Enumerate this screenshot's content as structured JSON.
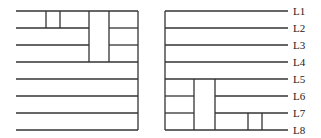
{
  "diagram": {
    "left_panel": {
      "rows_y": [
        11,
        28,
        45,
        62,
        79,
        96,
        113,
        130
      ],
      "x_start": 16,
      "x_end": 138
    },
    "right_panel": {
      "rows_y": [
        11,
        28,
        45,
        62,
        79,
        96,
        113,
        130
      ],
      "x_start": 165,
      "x_end": 288,
      "labels": [
        "L1",
        "L2",
        "L3",
        "L4",
        "L5",
        "L6",
        "L7",
        "L8"
      ]
    },
    "line_color": "#333333"
  }
}
